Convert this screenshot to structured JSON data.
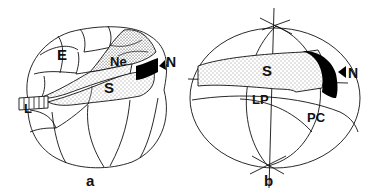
{
  "panels": [
    {
      "id": "a",
      "caption": "a",
      "labels": {
        "E": "E",
        "Ne": "Ne",
        "S": "S",
        "N": "N",
        "L": "L"
      }
    },
    {
      "id": "b",
      "caption": "b",
      "labels": {
        "S": "S",
        "LP": "LP",
        "PC": "PC",
        "N": "N"
      }
    }
  ],
  "colors": {
    "line": "#111111",
    "fill_black": "#000000",
    "background": "#ffffff"
  }
}
